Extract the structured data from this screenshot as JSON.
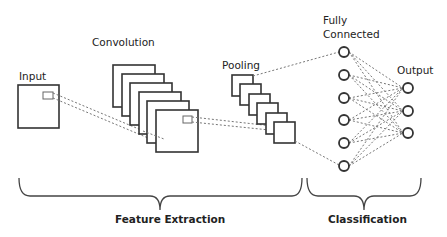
{
  "diagram": {
    "labels": {
      "input": "Input",
      "convolution": "Convolution",
      "pooling": "Pooling",
      "fully_connected_line1": "Fully",
      "fully_connected_line2": "Connected",
      "output": "Output",
      "feature_extraction": "Feature Extraction",
      "classification": "Classification"
    },
    "stages": [
      {
        "name": "Input",
        "maps": 1
      },
      {
        "name": "Convolution",
        "maps": 6
      },
      {
        "name": "Pooling",
        "maps": 6
      },
      {
        "name": "Fully Connected",
        "nodes": 6
      },
      {
        "name": "Output",
        "nodes": 3
      }
    ],
    "groups": [
      {
        "name": "Feature Extraction",
        "spans": [
          "Input",
          "Convolution",
          "Pooling"
        ]
      },
      {
        "name": "Classification",
        "spans": [
          "Fully Connected",
          "Output"
        ]
      }
    ],
    "colors": {
      "stroke": "#333333",
      "dashed": "#777777",
      "text": "#222222",
      "background": "#ffffff"
    }
  }
}
